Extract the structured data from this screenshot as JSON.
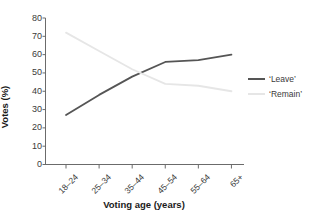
{
  "chart_data": {
    "type": "line",
    "title": "",
    "xlabel": "Voting age (years)",
    "ylabel": "Votes (%)",
    "categories": [
      "18–24",
      "25–34",
      "35–44",
      "45–54",
      "55–64",
      "65+"
    ],
    "series": [
      {
        "name": "‘Leave’",
        "values": [
          27,
          38,
          48,
          56,
          57,
          60
        ],
        "color": "#555555"
      },
      {
        "name": "‘Remain’",
        "values": [
          72,
          62,
          52,
          44,
          43,
          40
        ],
        "color": "#e6e6e6"
      }
    ],
    "ylim": [
      0,
      80
    ],
    "yticks": [
      0,
      10,
      20,
      30,
      40,
      50,
      60,
      70,
      80
    ],
    "ytick_labels": [
      "0",
      "10",
      "20",
      "30",
      "40",
      "50",
      "60",
      "70",
      "80"
    ],
    "grid": false,
    "legend_position": "right-middle",
    "xtick_rotation": -45
  },
  "legend": {
    "items": [
      {
        "label": "‘Leave’"
      },
      {
        "label": "‘Remain’"
      }
    ]
  },
  "axes": {
    "x_title": "Voting age (years)",
    "y_title": "Votes (%)"
  }
}
